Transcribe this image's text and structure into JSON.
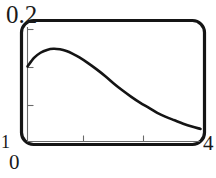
{
  "figure": {
    "frame_color": "#151515",
    "curve_color": "#141414",
    "axis_color": "#555555",
    "background": "#ffffff"
  },
  "labels": {
    "y_max": "0.2",
    "y_min": "1",
    "x_min": "0",
    "x_max": "4"
  },
  "chart_data": {
    "type": "line",
    "title": "",
    "xlabel": "",
    "ylabel": "",
    "xlim": [
      0,
      4
    ],
    "ylim": [
      0,
      0.2
    ],
    "grid": false,
    "legend": null,
    "xticks": [
      0,
      1,
      2,
      3,
      4
    ],
    "xticklabels": [
      "0",
      "",
      "",
      "",
      "4"
    ],
    "yticks": [
      0,
      0.05,
      0.1,
      0.15,
      0.2
    ],
    "yticklabels": [
      "1",
      "",
      "",
      "",
      "0.2"
    ],
    "series": [
      {
        "name": "curve",
        "x": [
          0.0,
          0.15,
          0.3,
          0.45,
          0.6,
          0.75,
          0.9,
          1.05,
          1.2,
          1.4,
          1.6,
          1.8,
          2.0,
          2.2,
          2.4,
          2.6,
          2.8,
          3.0,
          3.2,
          3.4,
          3.6,
          3.8,
          4.0
        ],
        "y": [
          0.131,
          0.146,
          0.155,
          0.16,
          0.162,
          0.161,
          0.158,
          0.153,
          0.147,
          0.137,
          0.126,
          0.114,
          0.101,
          0.089,
          0.078,
          0.068,
          0.059,
          0.05,
          0.043,
          0.037,
          0.031,
          0.026,
          0.022
        ]
      }
    ]
  }
}
